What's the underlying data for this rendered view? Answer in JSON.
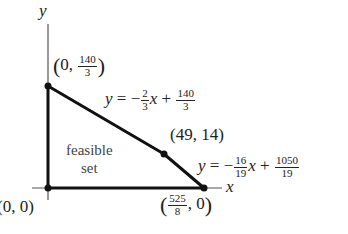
{
  "diagram": {
    "type": "feasible-region",
    "axes": {
      "x_label": "x",
      "y_label": "y"
    },
    "region_label": {
      "line1": "feasible",
      "line2": "set"
    },
    "vertices": [
      {
        "id": "origin",
        "label_a": "0",
        "label_b": "0",
        "x": 0,
        "y": 0
      },
      {
        "id": "y-intercept",
        "label_a": "0",
        "num": "140",
        "den": "3",
        "x": 0,
        "y": 46.667
      },
      {
        "id": "corner",
        "label": "(49, 14)",
        "x": 49,
        "y": 14
      },
      {
        "id": "x-intercept",
        "num": "525",
        "den": "8",
        "label_b": "0",
        "x": 65.625,
        "y": 0
      }
    ],
    "constraints": [
      {
        "id": "line-1",
        "lhs": "y",
        "eq": "=",
        "sign": "−",
        "slope_num": "2",
        "slope_den": "3",
        "var": "x",
        "plus": "+",
        "int_num": "140",
        "int_den": "3"
      },
      {
        "id": "line-2",
        "lhs": "y",
        "eq": "=",
        "sign": "−",
        "slope_num": "16",
        "slope_den": "19",
        "var": "x",
        "plus": "+",
        "int_num": "1050",
        "int_den": "19"
      }
    ],
    "comma": ","
  }
}
